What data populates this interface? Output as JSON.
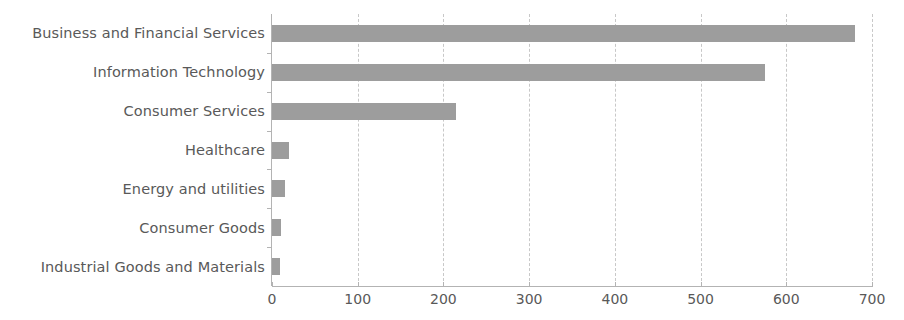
{
  "chart_data": {
    "type": "bar",
    "orientation": "horizontal",
    "title": "",
    "xlabel": "",
    "ylabel": "",
    "categories": [
      "Business and Financial Services",
      "Information Technology",
      "Consumer Services",
      "Healthcare",
      "Energy and utilities",
      "Consumer Goods",
      "Industrial Goods and Materials"
    ],
    "values": [
      680,
      575,
      215,
      20,
      15,
      10,
      9
    ],
    "xlim": [
      0,
      700
    ],
    "xticks": [
      0,
      100,
      200,
      300,
      400,
      500,
      600,
      700
    ],
    "xtick_labels": [
      "0",
      "100",
      "200",
      "300",
      "400",
      "500",
      "600",
      "700"
    ],
    "grid": "vertical-dashed",
    "legend": "none",
    "bar_color": "#9d9d9d",
    "axis_color": "#b3b3b3",
    "grid_color": "#c8c8c8",
    "label_color": "#595959"
  }
}
